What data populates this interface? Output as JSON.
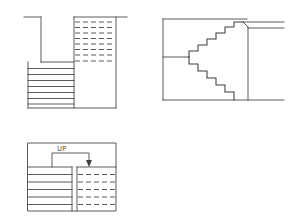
{
  "drawing": {
    "title": "Stair construction drawings",
    "sheet": {
      "width": 290,
      "height": 217,
      "background": "#ffffff",
      "line_color": "#4a4a4a"
    },
    "views": [
      {
        "id": "upper-plan",
        "name": "Upper floor stair plan",
        "position": {
          "x": 28,
          "y": 14,
          "w": 88,
          "h": 94
        },
        "elements": {
          "solid_treads": 7,
          "dashed_treads": 8,
          "break_line": true,
          "landing": true
        }
      },
      {
        "id": "section",
        "name": "Stair section elevation",
        "position": {
          "x": 160,
          "y": 16,
          "w": 120,
          "h": 90
        },
        "elements": {
          "upper_flight_steps": 7,
          "lower_flight_steps": 6,
          "stringer_line": true,
          "floor_line": true
        }
      },
      {
        "id": "lower-plan",
        "name": "Lower floor stair plan with direction of travel",
        "position": {
          "x": 28,
          "y": 143,
          "w": 88,
          "h": 68
        },
        "elements": {
          "solid_treads": 6,
          "dashed_treads": 5,
          "direction_label": "UP",
          "direction_arrow": "down-arrowhead"
        }
      }
    ],
    "labels": {
      "up": "UP"
    }
  }
}
